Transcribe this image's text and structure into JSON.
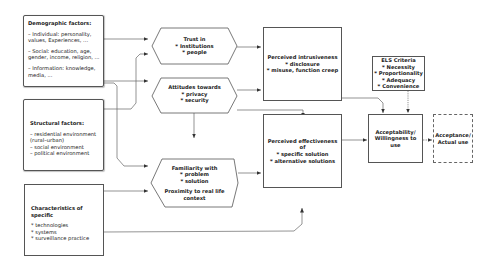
{
  "diagram": {
    "colors": {
      "stroke": "#555555",
      "text": "#222222",
      "background": "#ffffff"
    },
    "nodes": {
      "demographic": {
        "title": "Demographic factors:",
        "items": [
          "– Individual: personality,",
          "values, Experiences, ...",
          "– Social: education, age,",
          "gender, income, religion, ...",
          "– Information: knowledge,",
          "media, ..."
        ]
      },
      "structural": {
        "title": "Structural factors:",
        "items": [
          "– residential environment",
          "(rural–urban)",
          "– social environment",
          "– political environment"
        ]
      },
      "characteristics": {
        "title": "Characteristics of specific",
        "items": [
          "* technologies",
          "* systems",
          "* surveillance practice"
        ]
      },
      "trust": {
        "lines": [
          "Trust in",
          "* Institutions",
          "* people"
        ]
      },
      "attitudes": {
        "lines": [
          "Attitudes towards",
          "* privacy",
          "* security"
        ]
      },
      "familiarity": {
        "lines": [
          "Familiarity with",
          "* problem",
          "* solution"
        ],
        "extra": [
          "Proximity to real life",
          "context"
        ]
      },
      "intrusiveness": {
        "lines": [
          "Perceived intrusiveness",
          "* disclosure",
          "* misuse, function creep"
        ]
      },
      "effectiveness": {
        "lines": [
          "Perceived effectiveness of",
          "* specific solution",
          "* alternative solutions"
        ]
      },
      "els": {
        "lines": [
          "ELS Criteria",
          "* Necessity",
          "* Proportionality",
          "* Adequacy",
          "* Convenience"
        ]
      },
      "acceptability": {
        "lines": [
          "Acceptability/",
          "Willingness to use"
        ]
      },
      "acceptance": {
        "lines": [
          "Acceptance/",
          "Actual use"
        ]
      }
    }
  }
}
